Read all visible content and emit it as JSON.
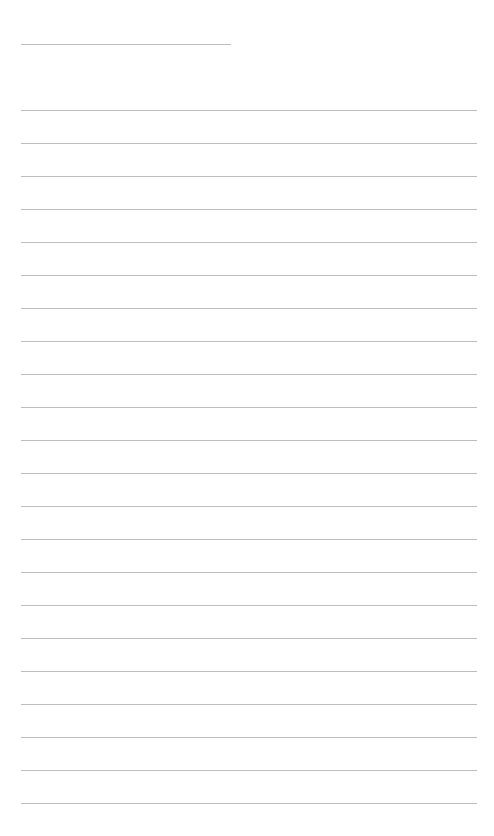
{
  "page": {
    "type": "lined-writing-sheet",
    "background_color": "#ffffff",
    "line_color": "#bdbdbd",
    "header_line": {
      "x": 21,
      "y": 44,
      "width": 210
    },
    "rules": {
      "x": 21,
      "width": 456,
      "first_y": 110,
      "spacing": 33,
      "count": 22
    }
  }
}
